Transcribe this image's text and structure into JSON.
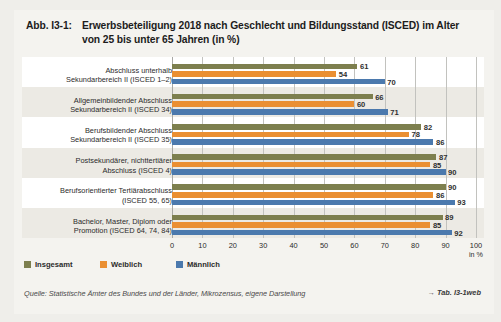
{
  "figure": {
    "number": "Abb. I3-1:",
    "title_line1": "Erwerbsbeteiligung 2018 nach Geschlecht und Bildungsstand (ISCED) im Alter",
    "title_line2": "von 25 bis unter 65 Jahren (in %)"
  },
  "source": {
    "text": "Quelle: Statistische Ämter des Bundes und der Länder, Mikrozensus, eigene Darstellung",
    "table_reference": "→ Tab. I3-1web"
  },
  "legend": {
    "items": [
      {
        "label": "Insgesamt",
        "color": "#7d7f4e"
      },
      {
        "label": "Weiblich",
        "color": "#ea8f32"
      },
      {
        "label": "Männlich",
        "color": "#4b79ad"
      }
    ]
  },
  "chart_data": {
    "type": "bar",
    "orientation": "horizontal",
    "title": "Erwerbsbeteiligung 2018 nach Geschlecht und Bildungsstand (ISCED) im Alter von 25 bis unter 65 Jahren (in %)",
    "xlabel": "in %",
    "ylabel": "",
    "xlim": [
      0,
      100
    ],
    "xticks": [
      0,
      10,
      20,
      30,
      40,
      50,
      60,
      70,
      80,
      90,
      100
    ],
    "xticklabels": [
      "0",
      "10",
      "20",
      "30",
      "40",
      "50",
      "60",
      "70",
      "80",
      "90",
      "100"
    ],
    "grid": true,
    "legend_position": "bottom-left",
    "categories": [
      [
        "Abschluss unterhalb",
        "Sekundarbereich II (ISCED 1–2)"
      ],
      [
        "Allgemeinbildender Abschluss",
        "Sekundarbereich II (ISCED 34)"
      ],
      [
        "Berufsbildender Abschluss",
        "Sekundarbereich II (ISCED 35)"
      ],
      [
        "Postsekundärer, nichttertiärer",
        "Abschluss (ISCED 4)"
      ],
      [
        "Berufsorientierter Tertiärabschluss",
        "(ISCED 55, 65)"
      ],
      [
        "Bachelor, Master, Diplom oder",
        "Promotion (ISCED 64, 74, 84)"
      ]
    ],
    "series": [
      {
        "name": "Insgesamt",
        "color": "#7d7f4e",
        "values": [
          61,
          66,
          82,
          87,
          90,
          89
        ]
      },
      {
        "name": "Weiblich",
        "color": "#ea8f32",
        "values": [
          54,
          60,
          78,
          85,
          86,
          85
        ]
      },
      {
        "name": "Männlich",
        "color": "#4b79ad",
        "values": [
          70,
          71,
          86,
          90,
          93,
          92
        ]
      }
    ]
  }
}
